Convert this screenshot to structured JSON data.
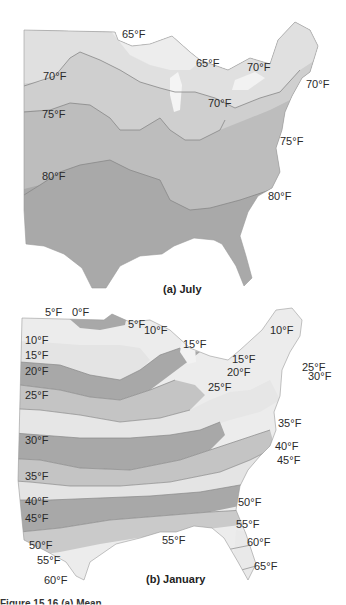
{
  "maps": [
    {
      "title": "(a) July",
      "month": "July",
      "isotherm_labels": [
        {
          "text": "65°F",
          "x": 122,
          "y": 28
        },
        {
          "text": "65°F",
          "x": 196,
          "y": 57
        },
        {
          "text": "70°F",
          "x": 247,
          "y": 61
        },
        {
          "text": "70°F",
          "x": 43,
          "y": 70
        },
        {
          "text": "70°F",
          "x": 306,
          "y": 78
        },
        {
          "text": "70°F",
          "x": 208,
          "y": 97
        },
        {
          "text": "75°F",
          "x": 42,
          "y": 108
        },
        {
          "text": "75°F",
          "x": 280,
          "y": 135
        },
        {
          "text": "80°F",
          "x": 42,
          "y": 170
        },
        {
          "text": "80°F",
          "x": 268,
          "y": 190
        }
      ],
      "colors": {
        "lightest": "#e6e6e6",
        "light": "#cfcfcf",
        "mid": "#bdbdbd",
        "dark": "#a9a9a9"
      }
    },
    {
      "title": "(b) January",
      "month": "January",
      "isotherm_labels": [
        {
          "text": "5°F",
          "x": 45,
          "y": 306
        },
        {
          "text": "0°F",
          "x": 72,
          "y": 306
        },
        {
          "text": "5°F",
          "x": 128,
          "y": 318
        },
        {
          "text": "10°F",
          "x": 144,
          "y": 324
        },
        {
          "text": "10°F",
          "x": 270,
          "y": 324
        },
        {
          "text": "10°F",
          "x": 25,
          "y": 334
        },
        {
          "text": "15°F",
          "x": 183,
          "y": 338
        },
        {
          "text": "15°F",
          "x": 25,
          "y": 349
        },
        {
          "text": "15°F",
          "x": 232,
          "y": 353
        },
        {
          "text": "25°F",
          "x": 302,
          "y": 361
        },
        {
          "text": "20°F",
          "x": 25,
          "y": 365
        },
        {
          "text": "20°F",
          "x": 227,
          "y": 366
        },
        {
          "text": "30°F",
          "x": 308,
          "y": 370
        },
        {
          "text": "25°F",
          "x": 208,
          "y": 381
        },
        {
          "text": "25°F",
          "x": 25,
          "y": 389
        },
        {
          "text": "35°F",
          "x": 278,
          "y": 417
        },
        {
          "text": "30°F",
          "x": 25,
          "y": 434
        },
        {
          "text": "40°F",
          "x": 275,
          "y": 440
        },
        {
          "text": "45°F",
          "x": 277,
          "y": 454
        },
        {
          "text": "35°F",
          "x": 25,
          "y": 470
        },
        {
          "text": "40°F",
          "x": 25,
          "y": 495
        },
        {
          "text": "50°F",
          "x": 238,
          "y": 496
        },
        {
          "text": "45°F",
          "x": 25,
          "y": 512
        },
        {
          "text": "55°F",
          "x": 236,
          "y": 518
        },
        {
          "text": "55°F",
          "x": 162,
          "y": 534
        },
        {
          "text": "50°F",
          "x": 29,
          "y": 539
        },
        {
          "text": "60°F",
          "x": 247,
          "y": 536
        },
        {
          "text": "55°F",
          "x": 37,
          "y": 554
        },
        {
          "text": "65°F",
          "x": 254,
          "y": 560
        },
        {
          "text": "60°F",
          "x": 44,
          "y": 574
        }
      ],
      "colors": {
        "lightest": "#ececec",
        "light": "#d3d3d3",
        "mid": "#c0c0c0",
        "dark": "#a8a8a8"
      }
    }
  ],
  "caption_partial": "Figure 15.16  (a) Mean ..."
}
